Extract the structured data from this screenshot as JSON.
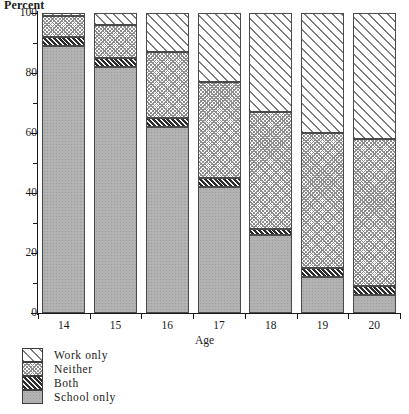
{
  "chart_data": {
    "type": "bar",
    "subtype": "stacked-bar-100",
    "title": "",
    "xlabel": "Age",
    "ylabel": "Percent",
    "ylim": [
      0,
      100
    ],
    "grid": false,
    "legend_position": "bottom-left",
    "categories": [
      "14",
      "15",
      "16",
      "17",
      "18",
      "19",
      "20"
    ],
    "ytick_labels": [
      "0",
      "20",
      "40",
      "60",
      "80",
      "100"
    ],
    "ytick_values": [
      0,
      20,
      40,
      60,
      80,
      100
    ],
    "yminor_tick_values": [
      10,
      30,
      50,
      70,
      90
    ],
    "stack_order_bottom_to_top": [
      "School only",
      "Both",
      "Neither",
      "Work only"
    ],
    "series": [
      {
        "name": "School only",
        "pattern": "solid-gray-stipple",
        "values": [
          89,
          82,
          62,
          42,
          26,
          12,
          6
        ]
      },
      {
        "name": "Both",
        "pattern": "dark-diagonal-hatch",
        "values": [
          3,
          3,
          3,
          3,
          2,
          3,
          3
        ]
      },
      {
        "name": "Neither",
        "pattern": "light-crosshatch",
        "values": [
          7,
          11,
          22,
          32,
          39,
          45,
          49
        ]
      },
      {
        "name": "Work only",
        "pattern": "wide-diagonal-hatch",
        "values": [
          1,
          4,
          13,
          23,
          33,
          40,
          42
        ]
      }
    ],
    "cumulative_tops": [
      [
        89,
        92,
        99,
        100
      ],
      [
        82,
        85,
        96,
        100
      ],
      [
        62,
        65,
        87,
        100
      ],
      [
        42,
        45,
        77,
        100
      ],
      [
        26,
        28,
        67,
        100
      ],
      [
        12,
        15,
        60,
        100
      ],
      [
        6,
        9,
        58,
        100
      ]
    ]
  },
  "axes": {
    "y_title": "Percent",
    "x_title": "Age"
  },
  "legend": {
    "items": [
      {
        "label": "Work only",
        "pattern": "wide-diagonal-hatch"
      },
      {
        "label": "Neither",
        "pattern": "light-crosshatch"
      },
      {
        "label": "Both",
        "pattern": "dark-diagonal-hatch"
      },
      {
        "label": "School only",
        "pattern": "solid-gray-stipple"
      }
    ]
  },
  "colors": {
    "axis": "#1a1a1a",
    "bar_outline": "#4a4a4a",
    "school_only": "#b2b2b2",
    "both": "#2b2b2b",
    "neither": "#ffffff",
    "work_only": "#ffffff",
    "background": "#ffffff"
  }
}
